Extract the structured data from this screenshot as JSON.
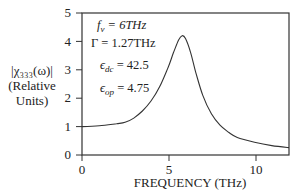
{
  "chart_data": {
    "type": "line",
    "title": "",
    "xlabel": "FREQUENCY (THz)",
    "ylabel": "|χ333(ω)| (Relative Units)",
    "ylabel_lines": [
      "|χ333(ω)|",
      "(Relative",
      "Units)"
    ],
    "xlim": [
      0,
      12
    ],
    "ylim": [
      0,
      5
    ],
    "x_ticks": [
      0,
      5,
      10
    ],
    "y_ticks": [
      0,
      1,
      2,
      3,
      4,
      5
    ],
    "grid": false,
    "annotations": [
      "f_v = 6THz",
      "Γ = 1.27THz",
      "ε_dc = 42.5",
      "ε_op = 4.75"
    ],
    "series": [
      {
        "name": "|χ333(ω)|",
        "x": [
          0,
          1,
          2,
          2.5,
          3,
          3.5,
          4,
          4.5,
          5,
          5.3,
          5.6,
          5.8,
          6.0,
          6.3,
          6.6,
          7,
          7.5,
          8,
          8.5,
          9,
          10,
          11,
          12
        ],
        "values": [
          1.0,
          1.03,
          1.1,
          1.15,
          1.3,
          1.55,
          1.9,
          2.4,
          3.1,
          3.6,
          4.05,
          4.2,
          4.1,
          3.6,
          2.9,
          2.1,
          1.45,
          1.05,
          0.8,
          0.62,
          0.45,
          0.33,
          0.26
        ]
      }
    ]
  },
  "labels": {
    "ylabel_1": "|χ₃₃₃(ω)|",
    "ylabel_2": "(Relative",
    "ylabel_3": "Units)",
    "xlabel": "FREQUENCY (THz)",
    "ann_fv": "f",
    "ann_fv_sub": "v",
    "ann_fv_val": " = 6THz",
    "ann_gamma": "Γ = 1.27THz",
    "ann_edc": "ϵ",
    "ann_edc_sub": "dc",
    "ann_edc_val": " = 42.5",
    "ann_eop": "ϵ",
    "ann_eop_sub": "op",
    "ann_eop_val": " = 4.75",
    "xtick_0": "0",
    "xtick_5": "5",
    "xtick_10": "10",
    "ytick_0": "0",
    "ytick_1": "1",
    "ytick_2": "2",
    "ytick_3": "3",
    "ytick_4": "4",
    "ytick_5": "5"
  }
}
